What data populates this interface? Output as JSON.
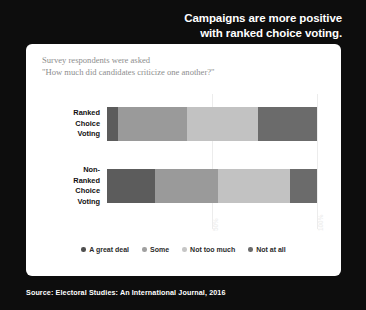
{
  "headline": {
    "line1": "Campaigns are more positive",
    "line2": "with ranked choice voting."
  },
  "subtitle": "Survey respondents were asked\n\"How much did candidates criticize one another?\"",
  "source": "Source: Electoral Studies: An International Journal, 2016",
  "chart_data": {
    "type": "bar",
    "orientation": "horizontal",
    "stacked": true,
    "title": "Campaigns are more positive with ranked choice voting.",
    "subtitle": "Survey respondents were asked \"How much did candidates criticize one another?\"",
    "xlabel": "",
    "ylabel": "",
    "xlim": [
      0,
      100
    ],
    "xticks": [
      "50%",
      "100%"
    ],
    "xtick_values": [
      50,
      100
    ],
    "grid": true,
    "legend_position": "bottom",
    "categories": [
      "Ranked Choice Voting",
      "Non-Ranked Choice Voting"
    ],
    "category_labels": [
      "Ranked\nChoice\nVoting",
      "Non-Ranked\nChoice\nVoting"
    ],
    "series": [
      {
        "name": "A great deal",
        "color": "#5c5c5c",
        "values": [
          5,
          23
        ]
      },
      {
        "name": "Some",
        "color": "#9a9a9a",
        "values": [
          33,
          30
        ]
      },
      {
        "name": "Not too much",
        "color": "#c2c2c2",
        "values": [
          34,
          34
        ]
      },
      {
        "name": "Not at all",
        "color": "#6b6b6b",
        "values": [
          28,
          13
        ]
      }
    ]
  },
  "legend": [
    {
      "label": "A great deal",
      "color": "#4f4f4f"
    },
    {
      "label": "Some",
      "color": "#a0a0a0"
    },
    {
      "label": "Not too much",
      "color": "#c6c6c6"
    },
    {
      "label": "Not at all",
      "color": "#6b6b6b"
    }
  ]
}
